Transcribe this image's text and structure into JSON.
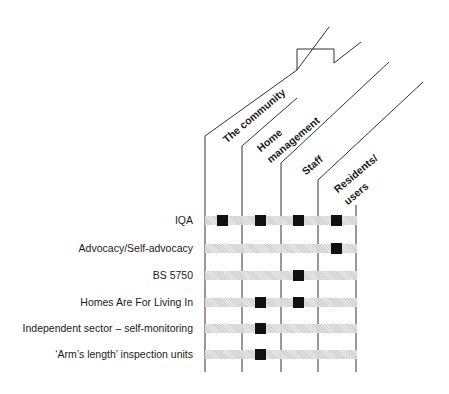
{
  "diagram": {
    "columns": [
      {
        "label": "The community"
      },
      {
        "label_line1": "Home",
        "label_line2": "management"
      },
      {
        "label": "Staff"
      },
      {
        "label_line1": "Residents/",
        "label_line2": "users"
      }
    ],
    "rows": [
      {
        "label": "IQA",
        "marks": [
          true,
          true,
          true,
          true
        ]
      },
      {
        "label": "Advocacy/Self-advocacy",
        "marks": [
          false,
          false,
          false,
          true
        ]
      },
      {
        "label": "BS 5750",
        "marks": [
          false,
          false,
          true,
          false
        ]
      },
      {
        "label": "Homes Are For Living In",
        "marks": [
          false,
          true,
          true,
          false
        ]
      },
      {
        "label": "Independent sector – self-monitoring",
        "marks": [
          false,
          true,
          false,
          false
        ]
      },
      {
        "label": "‘Arm’s length’ inspection units",
        "marks": [
          false,
          true,
          false,
          false
        ]
      }
    ],
    "colors": {
      "line": "#333333",
      "mark": "#111111",
      "band": "#d8d8d8"
    }
  }
}
